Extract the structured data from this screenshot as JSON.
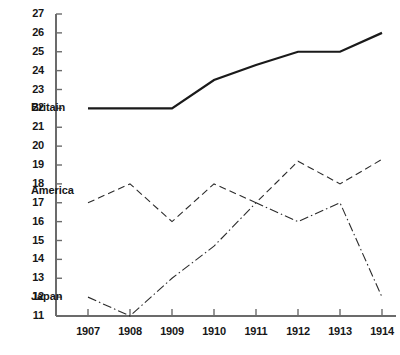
{
  "chart_data": {
    "type": "line",
    "title": "",
    "subtitle": "",
    "xlabel": "",
    "ylabel": "",
    "grid": false,
    "legend_position": "inline-left-labels",
    "categories": [
      "1907",
      "1908",
      "1909",
      "1910",
      "1911",
      "1912",
      "1913",
      "1914"
    ],
    "x": [
      1907,
      1908,
      1909,
      1910,
      1911,
      1912,
      1913,
      1914
    ],
    "xlim": [
      1907,
      1914
    ],
    "ylim": [
      11,
      27
    ],
    "y_ticks": [
      11,
      12,
      13,
      14,
      15,
      16,
      17,
      18,
      19,
      20,
      21,
      22,
      23,
      24,
      25,
      26,
      27
    ],
    "x_ticks": [
      "1907",
      "1908",
      "1909",
      "1910",
      "1911",
      "1912",
      "1913",
      "1914"
    ],
    "series": [
      {
        "name": "Britain",
        "line_style": "solid",
        "color": "#1a1a1a",
        "width": 2.2,
        "values": [
          22,
          22,
          22,
          23.5,
          24.3,
          25,
          25,
          26
        ]
      },
      {
        "name": "America",
        "line_style": "dashed",
        "color": "#2b2b2b",
        "width": 1.1,
        "values": [
          17,
          18,
          16,
          18,
          17,
          19.2,
          18,
          19.3
        ]
      },
      {
        "name": "Japan",
        "line_style": "dash-dot",
        "color": "#2b2b2b",
        "width": 1.1,
        "values": [
          12,
          11,
          13,
          14.7,
          17,
          16,
          17,
          12
        ]
      }
    ],
    "annotations": [
      {
        "text": "Britain",
        "series": "Britain",
        "value": 22,
        "year": 1907
      },
      {
        "text": "America",
        "series": "America",
        "value": 17.6,
        "year": 1907
      },
      {
        "text": "Japan",
        "series": "Japan",
        "value": 12,
        "year": 1907
      }
    ]
  },
  "axis": {
    "y_axis_name": "y-axis",
    "x_axis_name": "x-axis"
  }
}
